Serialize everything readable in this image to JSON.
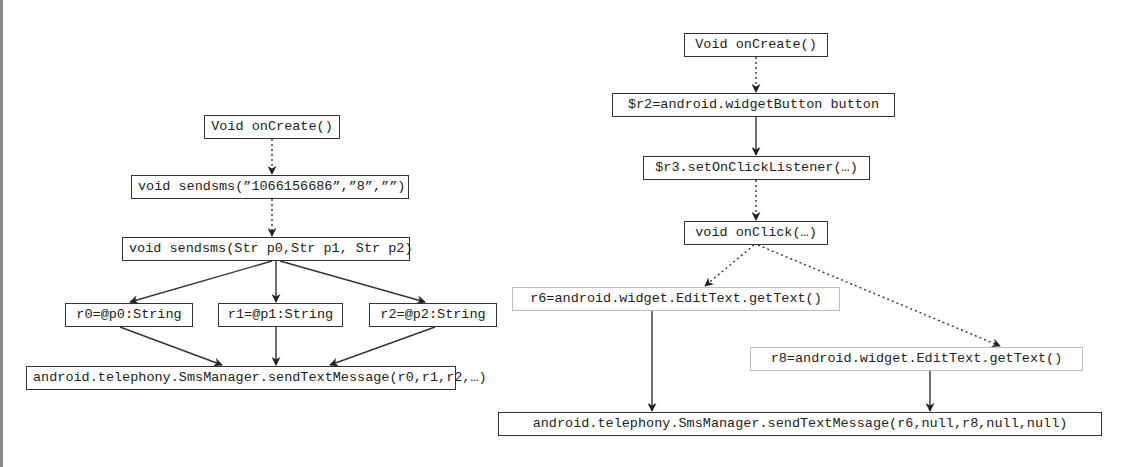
{
  "left_graph": {
    "nodes": {
      "oncreate": "Void onCreate()",
      "sendsms_call": "void sendsms(”1066156686”,”8”,””)",
      "sendsms_def": "void sendsms(Str p0,Str p1, Str p2)",
      "r0": "r0=@p0:String",
      "r1": "r1=@p1:String",
      "r2": "r2=@p2:String",
      "send_text": "android.telephony.SmsManager.sendTextMessage(r0,r1,r2,…)"
    },
    "edges": [
      {
        "from": "oncreate",
        "to": "sendsms_call",
        "style": "dotted"
      },
      {
        "from": "sendsms_call",
        "to": "sendsms_def",
        "style": "dotted"
      },
      {
        "from": "sendsms_def",
        "to": "r0",
        "style": "solid"
      },
      {
        "from": "sendsms_def",
        "to": "r1",
        "style": "solid"
      },
      {
        "from": "sendsms_def",
        "to": "r2",
        "style": "solid"
      },
      {
        "from": "r0",
        "to": "send_text",
        "style": "solid"
      },
      {
        "from": "r1",
        "to": "send_text",
        "style": "solid"
      },
      {
        "from": "r2",
        "to": "send_text",
        "style": "solid"
      }
    ]
  },
  "right_graph": {
    "nodes": {
      "oncreate": "Void onCreate()",
      "button": "$r2=android.widgetButton button",
      "listener": "$r3.setOnClickListener(…)",
      "onclick": "void onClick(…)",
      "r6": "r6=android.widget.EditText.getText()",
      "r8": "r8=android.widget.EditText.getText()",
      "send_text": "android.telephony.SmsManager.sendTextMessage(r6,null,r8,null,null)"
    },
    "edges": [
      {
        "from": "oncreate",
        "to": "button",
        "style": "dotted"
      },
      {
        "from": "button",
        "to": "listener",
        "style": "solid"
      },
      {
        "from": "listener",
        "to": "onclick",
        "style": "dotted"
      },
      {
        "from": "onclick",
        "to": "r6",
        "style": "dotted"
      },
      {
        "from": "onclick",
        "to": "r8",
        "style": "dotted"
      },
      {
        "from": "r6",
        "to": "send_text",
        "style": "solid"
      },
      {
        "from": "r8",
        "to": "send_text",
        "style": "solid"
      }
    ]
  },
  "colors": {
    "box_border": "#333333",
    "light_box_border": "#bdbdbd",
    "edge": "#333333",
    "background": "#ffffff"
  }
}
